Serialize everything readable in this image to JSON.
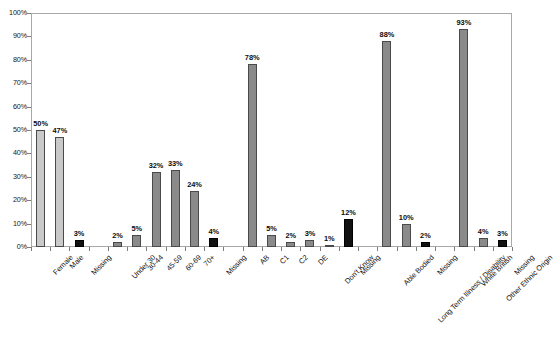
{
  "chart_data": {
    "type": "bar",
    "title": "",
    "xlabel": "",
    "ylabel": "",
    "ylim": [
      0,
      100
    ],
    "ytick_labels": [
      "0%",
      "10%",
      "20%",
      "30%",
      "40%",
      "50%",
      "60%",
      "70%",
      "80%",
      "90%",
      "100%"
    ],
    "ytick_values": [
      0,
      10,
      20,
      30,
      40,
      50,
      60,
      70,
      80,
      90,
      100
    ],
    "grid": false,
    "legend": "none",
    "value_suffix": "%",
    "categories": [
      "Female",
      "Male",
      "Missing",
      "",
      "Under 30",
      "30-44",
      "45-59",
      "60-69",
      "70+",
      "Missing",
      "",
      "AB",
      "C1",
      "C2",
      "DE",
      "Don't Know",
      "Missing",
      "",
      "Able Bodied",
      "Long Term Illness / Disability",
      "Missing",
      "",
      "White British",
      "Other Ethnic Origin",
      "Missing"
    ],
    "values": [
      50,
      47,
      3,
      null,
      2,
      5,
      32,
      33,
      24,
      4,
      null,
      78,
      5,
      2,
      3,
      1,
      12,
      null,
      88,
      10,
      2,
      null,
      93,
      4,
      3
    ],
    "value_labels": [
      "50%",
      "47%",
      "3%",
      "",
      "2%",
      "5%",
      "32%",
      "33%",
      "24%",
      "4%",
      "",
      "78%",
      "5%",
      "2%",
      "3%",
      "1%",
      "12%",
      "",
      "88%",
      "10%",
      "2%",
      "",
      "93%",
      "4%",
      "3%"
    ],
    "bar_colors": [
      "#c9c9c9",
      "#c9c9c9",
      "#111111",
      "",
      "#8a8a8a",
      "#8a8a8a",
      "#8a8a8a",
      "#8a8a8a",
      "#8a8a8a",
      "#111111",
      "",
      "#8a8a8a",
      "#8a8a8a",
      "#8a8a8a",
      "#8a8a8a",
      "#8a8a8a",
      "#111111",
      "",
      "#8a8a8a",
      "#8a8a8a",
      "#111111",
      "",
      "#8a8a8a",
      "#8a8a8a",
      "#111111"
    ],
    "groups": [
      {
        "name": "Gender",
        "categories": [
          "Female",
          "Male",
          "Missing"
        ],
        "values": [
          50,
          47,
          3
        ]
      },
      {
        "name": "Age",
        "categories": [
          "Under 30",
          "30-44",
          "45-59",
          "60-69",
          "70+",
          "Missing"
        ],
        "values": [
          2,
          5,
          32,
          33,
          24,
          4
        ]
      },
      {
        "name": "Social Grade",
        "categories": [
          "AB",
          "C1",
          "C2",
          "DE",
          "Don't Know",
          "Missing"
        ],
        "values": [
          78,
          5,
          2,
          3,
          1,
          12
        ]
      },
      {
        "name": "Disability",
        "categories": [
          "Able Bodied",
          "Long Term Illness / Disability",
          "Missing"
        ],
        "values": [
          88,
          10,
          2
        ]
      },
      {
        "name": "Ethnicity",
        "categories": [
          "White British",
          "Other Ethnic Origin",
          "Missing"
        ],
        "values": [
          93,
          4,
          3
        ]
      }
    ],
    "colors": {
      "bar_light": "#c9c9c9",
      "bar_mid": "#8a8a8a",
      "bar_black": "#111111",
      "bar_border": "#4a4a4a",
      "axis": "#a8a8a8",
      "text": "#121212",
      "background": "#ffffff"
    }
  },
  "caption": ""
}
